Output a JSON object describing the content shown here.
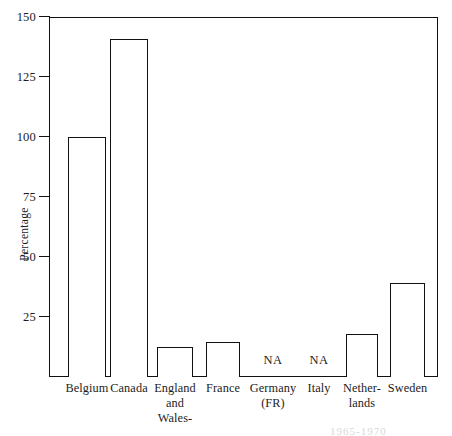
{
  "chart_data": {
    "type": "bar",
    "title": "",
    "xlabel": "",
    "ylabel": "Percentage",
    "ylim": [
      0,
      150
    ],
    "yticks": [
      25,
      50,
      75,
      100,
      125,
      150
    ],
    "ytick_labels": [
      "25",
      "50",
      "75",
      "100",
      "125",
      "150"
    ],
    "grid": false,
    "legend": "none",
    "bar_style": "hollow-outline",
    "categories": [
      "Belgium",
      "Canada",
      "England and Wales-",
      "France",
      "Germany (FR)",
      "Italy",
      "Netherlands",
      "Sweden"
    ],
    "category_lines": [
      [
        "Belgium"
      ],
      [
        "Canada"
      ],
      [
        "England",
        "and",
        "Wales-"
      ],
      [
        "France"
      ],
      [
        "Germany",
        "(FR)"
      ],
      [
        "Italy"
      ],
      [
        "Nether-",
        "lands"
      ],
      [
        "Sweden"
      ]
    ],
    "values": [
      100,
      141,
      12.5,
      14.5,
      null,
      null,
      18,
      39
    ],
    "missing_label": "NA",
    "missing_categories": [
      "Germany (FR)",
      "Italy"
    ],
    "bars": [
      {
        "category": "Belgium",
        "value": 100,
        "x": 68,
        "width": 38,
        "missing": false
      },
      {
        "category": "Canada",
        "value": 141,
        "x": 110,
        "width": 38,
        "missing": false
      },
      {
        "category": "England and Wales-",
        "value": 12.5,
        "x": 157,
        "width": 36,
        "missing": false
      },
      {
        "category": "France",
        "value": 14.5,
        "x": 206,
        "width": 34,
        "missing": false
      },
      {
        "category": "Germany (FR)",
        "value": null,
        "x": 255,
        "width": 36,
        "missing": true
      },
      {
        "category": "Italy",
        "value": null,
        "x": 303,
        "width": 32,
        "missing": true
      },
      {
        "category": "Netherlands",
        "value": 18,
        "x": 346,
        "width": 32,
        "missing": false
      },
      {
        "category": "Sweden",
        "value": 39,
        "x": 390,
        "width": 35,
        "missing": false
      }
    ],
    "caption_fragment": "1965-1970"
  },
  "colors": {
    "bar_outline": "#111111",
    "bar_fill": "#ffffff",
    "axis": "#111111",
    "text": "#1c1c1c",
    "background": "#ffffff"
  }
}
